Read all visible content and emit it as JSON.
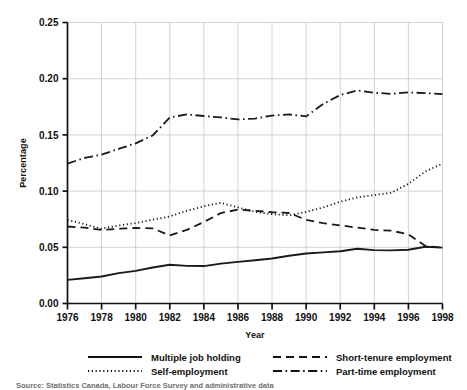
{
  "chart_data": {
    "type": "line",
    "title": "",
    "xlabel": "Year",
    "ylabel": "Percentage",
    "xlim": [
      1976,
      1998
    ],
    "ylim": [
      0.0,
      0.25
    ],
    "grid": true,
    "legend_position": "below",
    "x_ticks": [
      1976,
      1978,
      1980,
      1982,
      1984,
      1986,
      1988,
      1990,
      1992,
      1994,
      1996,
      1998
    ],
    "x_tick_labels": [
      "1976",
      "1978",
      "1980",
      "1982",
      "1984",
      "1986",
      "1988",
      "1990",
      "1992",
      "1994",
      "1996",
      "1998"
    ],
    "y_ticks": [
      0.0,
      0.05,
      0.1,
      0.15,
      0.2,
      0.25
    ],
    "y_tick_labels": [
      "0.00",
      "0.05",
      "0.10",
      "0.15",
      "0.20",
      "0.25"
    ],
    "x": [
      1976,
      1977,
      1978,
      1979,
      1980,
      1981,
      1982,
      1983,
      1984,
      1985,
      1986,
      1987,
      1988,
      1989,
      1990,
      1991,
      1992,
      1993,
      1994,
      1995,
      1996,
      1997,
      1998
    ],
    "series": [
      {
        "name": "Multiple job holding",
        "style": "solid",
        "color": "#1a1a1a",
        "values": [
          0.021,
          0.0225,
          0.024,
          0.027,
          0.029,
          0.032,
          0.0345,
          0.0335,
          0.0333,
          0.0355,
          0.037,
          0.0385,
          0.04,
          0.0425,
          0.0445,
          0.0455,
          0.0465,
          0.0487,
          0.0475,
          0.0473,
          0.0478,
          0.0505,
          0.0497
        ]
      },
      {
        "name": "Self-employment",
        "style": "dotted",
        "color": "#1a1a1a",
        "values": [
          0.0745,
          0.0705,
          0.0665,
          0.0695,
          0.0715,
          0.0745,
          0.0775,
          0.0825,
          0.0865,
          0.0895,
          0.0855,
          0.0815,
          0.0795,
          0.0785,
          0.0815,
          0.0855,
          0.0905,
          0.0945,
          0.0965,
          0.0985,
          0.1065,
          0.1175,
          0.1245
        ]
      },
      {
        "name": "Short-tenure employment",
        "style": "dashed",
        "color": "#1a1a1a",
        "values": [
          0.0685,
          0.0675,
          0.0655,
          0.0665,
          0.0672,
          0.0668,
          0.0605,
          0.0655,
          0.0725,
          0.0805,
          0.0835,
          0.0825,
          0.0812,
          0.0805,
          0.0745,
          0.0715,
          0.0695,
          0.0675,
          0.0655,
          0.0648,
          0.0615,
          0.0512,
          0.0497
        ]
      },
      {
        "name": "Part-time employment",
        "style": "dashdot",
        "color": "#1a1a1a",
        "values": [
          0.1245,
          0.1295,
          0.1325,
          0.1375,
          0.1425,
          0.1495,
          0.1655,
          0.1682,
          0.1668,
          0.1655,
          0.1638,
          0.1645,
          0.1672,
          0.1682,
          0.1665,
          0.1775,
          0.1855,
          0.1895,
          0.1875,
          0.1865,
          0.1878,
          0.1872,
          0.1862
        ]
      }
    ]
  },
  "legend": {
    "entries": [
      {
        "label": "Multiple job holding",
        "style": "solid"
      },
      {
        "label": "Short-tenure employment",
        "style": "dashed"
      },
      {
        "label": "Self-employment",
        "style": "dotted"
      },
      {
        "label": "Part-time employment",
        "style": "dashdot"
      }
    ]
  },
  "source": {
    "text": "Source: Statistics Canada, Labour Force Survey and administrative data"
  }
}
